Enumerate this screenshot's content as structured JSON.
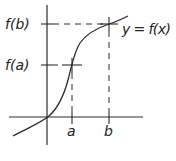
{
  "diagram": {
    "title": "",
    "colors": {
      "stroke": "#2a2a2a",
      "background": "#ffffff"
    },
    "labels": {
      "fb": "f(b)",
      "fa": "f(a)",
      "curve": "y = f(x)",
      "a": "a",
      "b": "b"
    },
    "axes": {
      "origin_px": [
        48,
        117
      ],
      "x_axis_px": [
        9,
        143
      ],
      "y_axis_px": [
        5,
        145
      ]
    },
    "points": {
      "a": {
        "x_px": 72,
        "fx_px": 65
      },
      "b": {
        "x_px": 109,
        "fx_px": 24
      }
    },
    "curve_path": "M13 136 C28 128 42 122 49 116 C58 108 64 95 68 80 C72 65 74 52 80 43 C87 33 97 28 109 24 C116 22 122 19 128 16"
  }
}
